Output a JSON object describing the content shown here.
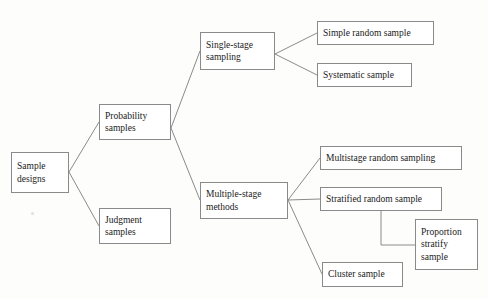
{
  "diagram": {
    "type": "tree",
    "title": "Sample designs",
    "orientation": "left-to-right",
    "background_color": "#fdfdfc",
    "box_fill_color": "#ffffff",
    "box_border_color": "#8a8a8a",
    "edge_color": "#8a8a8a",
    "text_color": "#1a1a1a",
    "nodes": [
      {
        "id": "sample-designs",
        "label": "Sample\ndesigns",
        "level": 0,
        "align": "left",
        "x": 11,
        "y": 152,
        "w": 58,
        "h": 41
      },
      {
        "id": "probability-samples",
        "label": "Probability\nsamples",
        "level": 1,
        "align": "left",
        "x": 99,
        "y": 104,
        "w": 72,
        "h": 36
      },
      {
        "id": "judgment-samples",
        "label": "Judgment\nsamples",
        "level": 1,
        "align": "left",
        "x": 99,
        "y": 208,
        "w": 72,
        "h": 36
      },
      {
        "id": "single-stage-sampling",
        "label": "Single-stage\nsampling",
        "level": 2,
        "align": "left",
        "x": 200,
        "y": 32,
        "w": 75,
        "h": 38
      },
      {
        "id": "multiple-stage-methods",
        "label": "Multiple-stage\nmethods",
        "level": 2,
        "align": "left",
        "x": 200,
        "y": 182,
        "w": 88,
        "h": 37
      },
      {
        "id": "simple-random-sample",
        "label": "Simple random sample",
        "level": 3,
        "align": "left",
        "x": 317,
        "y": 21,
        "w": 117,
        "h": 24
      },
      {
        "id": "systematic-sample",
        "label": "Systematic sample",
        "level": 3,
        "align": "left",
        "x": 317,
        "y": 63,
        "w": 95,
        "h": 24
      },
      {
        "id": "multistage-random-sampling",
        "label": "Multistage random sampling",
        "level": 3,
        "align": "left",
        "x": 320,
        "y": 146,
        "w": 142,
        "h": 24
      },
      {
        "id": "stratified-random-sample",
        "label": "Stratified random sample",
        "level": 3,
        "align": "left",
        "x": 320,
        "y": 187,
        "w": 122,
        "h": 24
      },
      {
        "id": "cluster-sample",
        "label": "Cluster sample",
        "level": 3,
        "align": "left",
        "x": 322,
        "y": 262,
        "w": 81,
        "h": 25
      },
      {
        "id": "proportion-stratify-sample",
        "label": "Proportion\nstratify\nsample",
        "level": 4,
        "align": "left",
        "x": 415,
        "y": 219,
        "w": 63,
        "h": 51
      }
    ],
    "edges": [
      {
        "from": "sample-designs",
        "to": "probability-samples",
        "path": "M 69,172 L 99,122"
      },
      {
        "from": "sample-designs",
        "to": "judgment-samples",
        "path": "M 69,172 L 99,226"
      },
      {
        "from": "probability-samples",
        "to": "single-stage-sampling",
        "path": "M 171,128 L 200,51"
      },
      {
        "from": "probability-samples",
        "to": "multiple-stage-methods",
        "path": "M 171,128 L 200,200"
      },
      {
        "from": "single-stage-sampling",
        "to": "simple-random-sample",
        "path": "M 275,54 L 317,33"
      },
      {
        "from": "single-stage-sampling",
        "to": "systematic-sample",
        "path": "M 275,54 L 317,75"
      },
      {
        "from": "multiple-stage-methods",
        "to": "multistage-random-sampling",
        "path": "M 288,200 L 320,158"
      },
      {
        "from": "multiple-stage-methods",
        "to": "stratified-random-sample",
        "path": "M 288,200 L 320,199"
      },
      {
        "from": "multiple-stage-methods",
        "to": "cluster-sample",
        "path": "M 288,200 L 322,274"
      },
      {
        "from": "stratified-random-sample",
        "to": "proportion-stratify-sample",
        "path": "M 381,211 L 381,245 L 415,245"
      }
    ]
  }
}
